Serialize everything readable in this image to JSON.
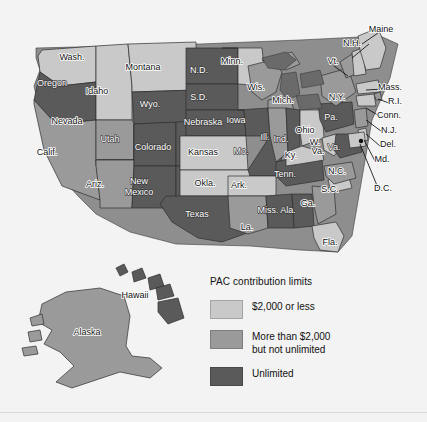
{
  "figure": {
    "ghost_text": "· · · · · ·   · · · ·  · · · ·",
    "background_color": "#f3f3f3"
  },
  "legend": {
    "title": "PAC contribution limits",
    "items": [
      {
        "label": "$2,000 or less",
        "color": "#c9c9c9",
        "key": "light"
      },
      {
        "label": "More than $2,000\nbut not unlimited",
        "line1": "More than $2,000",
        "line2": "but not unlimited",
        "color": "#9a9a9a",
        "key": "medium"
      },
      {
        "label": "Unlimited",
        "color": "#5a5a5a",
        "key": "dark"
      }
    ]
  },
  "map": {
    "type": "choropleth-us-states",
    "colors": {
      "light": "#c9c9c9",
      "medium": "#9a9a9a",
      "dark": "#5a5a5a",
      "water": "#f3f3f3",
      "lakes": "#6a6a6a"
    },
    "labels": [
      {
        "name": "Wash.",
        "x": 72,
        "y": 58,
        "cls": ""
      },
      {
        "name": "Oregon",
        "x": 52,
        "y": 84,
        "cls": "ondark"
      },
      {
        "name": "Idaho",
        "x": 97,
        "y": 92,
        "cls": ""
      },
      {
        "name": "Montana",
        "x": 143,
        "y": 68,
        "cls": ""
      },
      {
        "name": "Wyo.",
        "x": 150,
        "y": 105,
        "cls": "ondark"
      },
      {
        "name": "Nevada",
        "x": 67,
        "y": 122,
        "cls": ""
      },
      {
        "name": "Utah",
        "x": 110,
        "y": 140,
        "cls": "ondark"
      },
      {
        "name": "Calif.",
        "x": 47,
        "y": 153,
        "cls": ""
      },
      {
        "name": "Ariz.",
        "x": 95,
        "y": 185,
        "cls": ""
      },
      {
        "name": "Colorado",
        "x": 153,
        "y": 148,
        "cls": "ondark"
      },
      {
        "name": "New",
        "x": 139,
        "y": 182,
        "cls": "ondark"
      },
      {
        "name": "Mexico",
        "x": 139,
        "y": 193,
        "cls": "ondark"
      },
      {
        "name": "N.D.",
        "x": 199,
        "y": 71,
        "cls": "ondark"
      },
      {
        "name": "S.D.",
        "x": 199,
        "y": 98,
        "cls": "ondark"
      },
      {
        "name": "Nebraska",
        "x": 203,
        "y": 123,
        "cls": "ondark"
      },
      {
        "name": "Kansas",
        "x": 203,
        "y": 153,
        "cls": ""
      },
      {
        "name": "Okla.",
        "x": 205,
        "y": 184,
        "cls": ""
      },
      {
        "name": "Texas",
        "x": 197,
        "y": 215,
        "cls": "ondark"
      },
      {
        "name": "Minn.",
        "x": 232,
        "y": 62,
        "cls": ""
      },
      {
        "name": "Iowa",
        "x": 236,
        "y": 121,
        "cls": "ondark"
      },
      {
        "name": "Mo.",
        "x": 241,
        "y": 152,
        "cls": "ondark"
      },
      {
        "name": "Ark.",
        "x": 239,
        "y": 186,
        "cls": ""
      },
      {
        "name": "La.",
        "x": 247,
        "y": 228,
        "cls": ""
      },
      {
        "name": "Wis.",
        "x": 256,
        "y": 88,
        "cls": ""
      },
      {
        "name": "Ill.",
        "x": 265,
        "y": 138,
        "cls": "ondark"
      },
      {
        "name": "Miss.",
        "x": 268,
        "y": 211,
        "cls": "ondark"
      },
      {
        "name": "Mich.",
        "x": 283,
        "y": 101,
        "cls": ""
      },
      {
        "name": "Ind.",
        "x": 281,
        "y": 140,
        "cls": "ondark"
      },
      {
        "name": "Ky.",
        "x": 291,
        "y": 156,
        "cls": ""
      },
      {
        "name": "Tenn.",
        "x": 285,
        "y": 175,
        "cls": "ondark"
      },
      {
        "name": "Ala.",
        "x": 288,
        "y": 211,
        "cls": "ondark"
      },
      {
        "name": "Ohio",
        "x": 305,
        "y": 131,
        "cls": ""
      },
      {
        "name": "W.",
        "x": 315,
        "y": 143,
        "cls": ""
      },
      {
        "name": "Va.",
        "x": 318,
        "y": 152,
        "cls": ""
      },
      {
        "name": "Va.",
        "x": 334,
        "y": 148,
        "cls": "ondark"
      },
      {
        "name": "Ga.",
        "x": 308,
        "y": 204,
        "cls": ""
      },
      {
        "name": "Fla.",
        "x": 330,
        "y": 243,
        "cls": ""
      },
      {
        "name": "S.C.",
        "x": 330,
        "y": 190,
        "cls": ""
      },
      {
        "name": "N.C.",
        "x": 337,
        "y": 172,
        "cls": ""
      },
      {
        "name": "Pa.",
        "x": 331,
        "y": 118,
        "cls": "ondark"
      },
      {
        "name": "N.Y.",
        "x": 337,
        "y": 98,
        "cls": ""
      },
      {
        "name": "Vt.",
        "x": 333,
        "y": 62,
        "cls": ""
      },
      {
        "name": "N.H.",
        "x": 352,
        "y": 44,
        "cls": ""
      },
      {
        "name": "Maine",
        "x": 381,
        "y": 30,
        "cls": ""
      },
      {
        "name": "Mass.",
        "x": 390,
        "y": 88,
        "cls": ""
      },
      {
        "name": "R.I.",
        "x": 395,
        "y": 102,
        "cls": ""
      },
      {
        "name": "Conn.",
        "x": 389,
        "y": 116,
        "cls": ""
      },
      {
        "name": "N.J.",
        "x": 389,
        "y": 131,
        "cls": ""
      },
      {
        "name": "Del.",
        "x": 388,
        "y": 145,
        "cls": ""
      },
      {
        "name": "Md.",
        "x": 382,
        "y": 160,
        "cls": ""
      },
      {
        "name": "D.C.",
        "x": 383,
        "y": 189,
        "cls": ""
      },
      {
        "name": "Hawaii",
        "x": 135,
        "y": 296,
        "cls": ""
      },
      {
        "name": "Alaska",
        "x": 87,
        "y": 333,
        "cls": ""
      }
    ],
    "classification": {
      "light": [
        "Wash.",
        "Montana",
        "Idaho",
        "Minn.",
        "Kansas",
        "Okla.",
        "Ark.",
        "Ohio",
        "Ky.",
        "W. Va.",
        "Fla.",
        "N.H.",
        "Mass.",
        "Conn.",
        "Del.",
        "Md.",
        "D.C.",
        "Maine"
      ],
      "medium": [
        "Calif.",
        "Nevada",
        "Ariz.",
        "Wis.",
        "Ill.",
        "Mich.",
        "Ga.",
        "S.C.",
        "La.",
        "N.C.",
        "N.Y.",
        "Vt.",
        "R.I.",
        "N.J.",
        "Alaska"
      ],
      "dark": [
        "Oregon",
        "Utah",
        "Wyo.",
        "Colorado",
        "New Mexico",
        "N.D.",
        "S.D.",
        "Nebraska",
        "Iowa",
        "Mo.",
        "Texas",
        "Miss.",
        "Ala.",
        "Tenn.",
        "Ind.",
        "Pa.",
        "Va.",
        "Hawaii"
      ]
    }
  }
}
